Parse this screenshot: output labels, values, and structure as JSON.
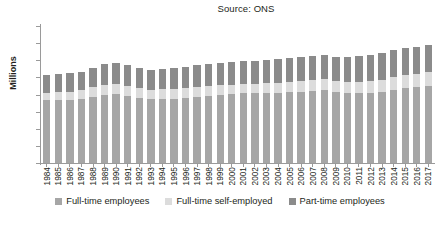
{
  "source_note": "Source: ONS",
  "axis": {
    "ylabel": "Millions",
    "yticks": [
      "0",
      "5",
      "10",
      "15",
      "20",
      "25",
      "30",
      "35",
      "40"
    ],
    "ylim_min": 0,
    "ylim_max": 40
  },
  "legend": {
    "items": [
      {
        "label": "Full-time employees",
        "color": "#a6a6a6"
      },
      {
        "label": "Full-time self-employed",
        "color": "#dcdcdc"
      },
      {
        "label": "Part-time employees",
        "color": "#8b8b8b"
      }
    ]
  },
  "chart_data": {
    "type": "bar",
    "stacked": true,
    "title": "",
    "subtitle": "Source: ONS",
    "xlabel": "",
    "ylabel": "Millions",
    "ylim": [
      0,
      40
    ],
    "ytick_step": 5,
    "grid": false,
    "legend_position": "bottom",
    "categories": [
      "1984",
      "1985",
      "1986",
      "1987",
      "1988",
      "1989",
      "1990",
      "1991",
      "1992",
      "1993",
      "1994",
      "1995",
      "1996",
      "1997",
      "1998",
      "1999",
      "2000",
      "2001",
      "2002",
      "2003",
      "2004",
      "2005",
      "2006",
      "2007",
      "2008",
      "2009",
      "2010",
      "2011",
      "2012",
      "2013",
      "2014",
      "2015",
      "2016",
      "2017"
    ],
    "series": [
      {
        "name": "Full-time employees",
        "color": "#a6a6a6",
        "values": [
          18.3,
          18.4,
          18.4,
          18.8,
          19.4,
          19.9,
          20.1,
          19.6,
          19.0,
          18.6,
          18.7,
          18.8,
          19.0,
          19.4,
          19.7,
          19.9,
          20.1,
          20.3,
          20.3,
          20.4,
          20.5,
          20.7,
          20.8,
          21.0,
          21.2,
          20.7,
          20.5,
          20.5,
          20.5,
          20.8,
          21.4,
          21.8,
          22.2,
          22.5
        ]
      },
      {
        "name": "Full-time self-employed",
        "color": "#dcdcdc",
        "values": [
          2.2,
          2.3,
          2.4,
          2.6,
          2.8,
          3.0,
          3.0,
          2.9,
          2.8,
          2.8,
          2.9,
          2.9,
          2.9,
          2.9,
          2.8,
          2.8,
          2.8,
          2.8,
          2.9,
          3.0,
          3.0,
          3.1,
          3.2,
          3.3,
          3.3,
          3.2,
          3.2,
          3.2,
          3.4,
          3.5,
          3.7,
          3.8,
          3.9,
          4.0
        ]
      },
      {
        "name": "Part-time employees",
        "color": "#8b8b8b",
        "values": [
          5.3,
          5.3,
          5.4,
          5.3,
          5.6,
          6.0,
          6.0,
          6.0,
          5.9,
          5.9,
          5.9,
          6.0,
          6.1,
          6.2,
          6.3,
          6.4,
          6.5,
          6.6,
          6.7,
          6.8,
          6.8,
          6.8,
          6.9,
          6.9,
          7.0,
          7.2,
          7.3,
          7.5,
          7.6,
          7.7,
          7.8,
          7.9,
          7.9,
          7.9
        ]
      }
    ],
    "totals": [
      25.8,
      26.0,
      26.2,
      26.7,
      27.8,
      28.9,
      29.1,
      28.5,
      27.7,
      27.3,
      27.5,
      27.7,
      28.0,
      28.5,
      28.8,
      29.1,
      29.4,
      29.7,
      29.9,
      30.2,
      30.3,
      30.6,
      30.9,
      31.2,
      31.5,
      31.1,
      31.0,
      31.2,
      31.5,
      32.0,
      32.9,
      33.5,
      34.0,
      34.4
    ]
  }
}
